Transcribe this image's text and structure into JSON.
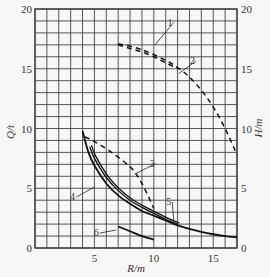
{
  "chart_data": {
    "type": "line",
    "title": "",
    "xlabel": "R/m",
    "ylabel_left": "Q/t",
    "ylabel_right": "H/m",
    "xlim": [
      0,
      17
    ],
    "ylim": [
      0,
      20
    ],
    "grid": true,
    "grid_step": 1,
    "legend": "none (curves numbered 1–6 with leader lines)",
    "x_ticks": [
      {
        "value": 5,
        "label": "5"
      },
      {
        "value": 10,
        "label": "10"
      },
      {
        "value": 15,
        "label": "15"
      }
    ],
    "y_ticks_left": [
      {
        "value": 0,
        "label": "0"
      },
      {
        "value": 5,
        "label": "5"
      },
      {
        "value": 10,
        "label": "10"
      },
      {
        "value": 15,
        "label": "15"
      },
      {
        "value": 20,
        "label": "20"
      }
    ],
    "y_ticks_right": [
      {
        "value": 0,
        "label": "0"
      },
      {
        "value": 5,
        "label": "5"
      },
      {
        "value": 10,
        "label": "10"
      },
      {
        "value": 15,
        "label": "15"
      },
      {
        "value": 20,
        "label": "20"
      }
    ],
    "series": [
      {
        "name": "1",
        "style": "dashed",
        "axis": "right",
        "x": [
          7,
          8,
          9,
          10,
          11,
          12
        ],
        "y": [
          17.0,
          16.7,
          16.4,
          16.0,
          15.5,
          15.0
        ],
        "label_pos": [
          11.4,
          18.6
        ],
        "leader_to": [
          10.1,
          17.0
        ]
      },
      {
        "name": "2",
        "style": "dashed",
        "axis": "right",
        "x": [
          7,
          9,
          11,
          12,
          13,
          14,
          15,
          16,
          17
        ],
        "y": [
          17.1,
          16.6,
          15.7,
          15.1,
          14.3,
          13.2,
          11.8,
          10.0,
          7.8
        ],
        "label_pos": [
          13.3,
          15.4
        ],
        "leader_to": [
          12.1,
          14.6
        ]
      },
      {
        "name": "3",
        "style": "dashed",
        "axis": "left",
        "x": [
          4.2,
          5,
          6,
          7,
          8,
          8.5,
          9,
          9.5,
          10
        ],
        "y": [
          9.3,
          8.9,
          8.3,
          7.6,
          6.8,
          6.2,
          5.4,
          4.4,
          3.3
        ],
        "label_pos": [
          9.9,
          6.8
        ],
        "leader_to": [
          8.4,
          6.2
        ]
      },
      {
        "name": "4",
        "style": "solid-double",
        "axis": "left",
        "x": [
          4.6,
          5,
          6,
          7,
          8,
          9,
          10,
          11,
          12
        ],
        "y": [
          8.5,
          7.5,
          5.9,
          4.8,
          4.0,
          3.4,
          2.9,
          2.4,
          2.0
        ],
        "label_pos": [
          3.2,
          4.0
        ],
        "leader_to": [
          5.0,
          5.1
        ]
      },
      {
        "name": "5",
        "style": "solid",
        "axis": "left",
        "x": [
          4.0,
          4.5,
          5,
          6,
          7,
          8,
          9,
          10,
          11,
          12,
          13,
          14,
          15,
          16,
          17
        ],
        "y": [
          9.8,
          8.0,
          6.9,
          5.4,
          4.4,
          3.7,
          3.1,
          2.7,
          2.3,
          1.9,
          1.6,
          1.35,
          1.15,
          1.0,
          0.9
        ],
        "label_pos": [
          11.3,
          3.6
        ],
        "leader_to": [
          11.7,
          2.0
        ]
      },
      {
        "name": "6",
        "style": "solid",
        "axis": "left",
        "x": [
          7.0,
          8,
          9,
          10
        ],
        "y": [
          1.8,
          1.4,
          1.0,
          0.7
        ],
        "label_pos": [
          5.2,
          1.0
        ],
        "leader_to": [
          6.8,
          1.5
        ]
      }
    ]
  }
}
